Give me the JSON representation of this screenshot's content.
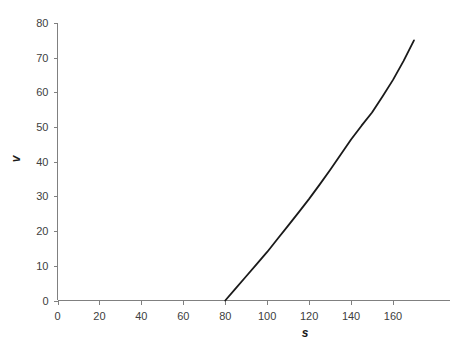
{
  "chart_data": {
    "type": "line",
    "title": "",
    "subtitle": "",
    "xlabel": "s",
    "ylabel": "v",
    "xlim": [
      0,
      170
    ],
    "ylim": [
      0,
      80
    ],
    "xticks": [
      0,
      20,
      40,
      60,
      80,
      100,
      120,
      140,
      160
    ],
    "yticks": [
      0,
      10,
      20,
      30,
      40,
      50,
      60,
      70,
      80
    ],
    "xtick_labels": [
      "0",
      "20",
      "40",
      "60",
      "80",
      "100",
      "120",
      "140",
      "160"
    ],
    "ytick_labels": [
      "0",
      "10",
      "20",
      "30",
      "40",
      "50",
      "60",
      "70",
      "80"
    ],
    "grid": false,
    "legend": null,
    "legend_position": "none",
    "line_color": "#1a1a1a",
    "axis_color": "#808080",
    "text_color": "#404040",
    "background_color": "#ffffff",
    "series": [
      {
        "name": "v",
        "x": [
          80,
          85,
          90,
          95,
          100,
          105,
          110,
          115,
          120,
          125,
          130,
          135,
          140,
          145,
          150,
          155,
          160,
          165,
          170
        ],
        "y": [
          0,
          3.5,
          7.0,
          10.5,
          14.0,
          17.8,
          21.6,
          25.4,
          29.3,
          33.4,
          37.6,
          42.0,
          46.4,
          50.4,
          54.2,
          58.8,
          63.6,
          69.0,
          75.0
        ]
      }
    ],
    "annotations": []
  },
  "axis": {
    "y_title": "v",
    "x_title": "s"
  }
}
